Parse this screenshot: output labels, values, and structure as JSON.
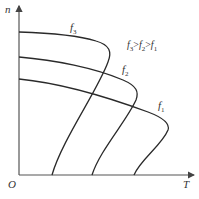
{
  "axes": {
    "y_label": "n",
    "x_label": "T",
    "origin_label": "O"
  },
  "curves": [
    {
      "id": "f3",
      "label": "f",
      "sub": "3"
    },
    {
      "id": "f2",
      "label": "f",
      "sub": "2"
    },
    {
      "id": "f1",
      "label": "f",
      "sub": "1"
    }
  ],
  "annotation": {
    "parts": [
      "f",
      "3",
      ">",
      "f",
      "2",
      ">",
      "f",
      "1"
    ]
  },
  "colors": {
    "line": "#2a2a2a",
    "axis": "#555555"
  }
}
